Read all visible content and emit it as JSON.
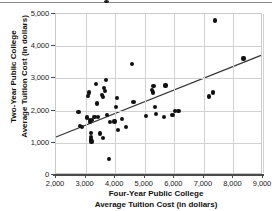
{
  "chart_data": {
    "type": "scatter",
    "title": "",
    "xlabel": "Four-Year Public College Average Tuition Cost (in dollars)",
    "xlabel_line1": "Four-Year Public College",
    "xlabel_line2": "Average Tuition Cost (in dollars)",
    "ylabel": "Two-Year Public College Average Tuition Cost (in dollars)",
    "ylabel_line1": "Two-Year Public College",
    "ylabel_line2": "Average Tuition Cost (in dollars)",
    "xlim": [
      2000,
      9000
    ],
    "ylim": [
      0,
      5000
    ],
    "xticks": [
      2000,
      3000,
      4000,
      5000,
      6000,
      7000,
      8000,
      9000
    ],
    "xtick_labels": [
      "2,000",
      "3,000",
      "4,000",
      "5,000",
      "6,000",
      "7,000",
      "8,000",
      "9,000"
    ],
    "yticks": [
      0,
      1000,
      2000,
      3000,
      4000,
      5000
    ],
    "ytick_labels": [
      "0",
      "1,000",
      "2,000",
      "3,000",
      "4,000",
      "5,000"
    ],
    "grid": true,
    "legend": "none",
    "marker_color": "#111111",
    "trendline_color": "#333333",
    "trendline": {
      "x": [
        2000,
        9000
      ],
      "y": [
        1130,
        3700
      ],
      "note": "least-squares line of best fit"
    },
    "points": [
      {
        "x": 2760,
        "y": 1960
      },
      {
        "x": 2800,
        "y": 1520
      },
      {
        "x": 2880,
        "y": 1500
      },
      {
        "x": 3040,
        "y": 1800
      },
      {
        "x": 3060,
        "y": 1770
      },
      {
        "x": 3080,
        "y": 2450
      },
      {
        "x": 3120,
        "y": 2560
      },
      {
        "x": 3140,
        "y": 1720
      },
      {
        "x": 3150,
        "y": 1640
      },
      {
        "x": 3170,
        "y": 1310
      },
      {
        "x": 3180,
        "y": 1180
      },
      {
        "x": 3190,
        "y": 1100
      },
      {
        "x": 3200,
        "y": 1040
      },
      {
        "x": 3220,
        "y": 1700
      },
      {
        "x": 3300,
        "y": 1790
      },
      {
        "x": 3340,
        "y": 2820
      },
      {
        "x": 3380,
        "y": 2220
      },
      {
        "x": 3420,
        "y": 1800
      },
      {
        "x": 3500,
        "y": 1290
      },
      {
        "x": 3560,
        "y": 2480
      },
      {
        "x": 3580,
        "y": 2410
      },
      {
        "x": 3600,
        "y": 1150
      },
      {
        "x": 3620,
        "y": 2700
      },
      {
        "x": 3660,
        "y": 2620
      },
      {
        "x": 3680,
        "y": 2960
      },
      {
        "x": 3720,
        "y": 1870
      },
      {
        "x": 3780,
        "y": 500
      },
      {
        "x": 3820,
        "y": 1640
      },
      {
        "x": 3980,
        "y": 1660
      },
      {
        "x": 4020,
        "y": 2100
      },
      {
        "x": 4060,
        "y": 2390
      },
      {
        "x": 4100,
        "y": 1410
      },
      {
        "x": 4240,
        "y": 1740
      },
      {
        "x": 4380,
        "y": 1500
      },
      {
        "x": 4560,
        "y": 3440
      },
      {
        "x": 4620,
        "y": 2260
      },
      {
        "x": 5040,
        "y": 1820
      },
      {
        "x": 5240,
        "y": 2640
      },
      {
        "x": 5280,
        "y": 2560
      },
      {
        "x": 5300,
        "y": 2760
      },
      {
        "x": 5340,
        "y": 2120
      },
      {
        "x": 5380,
        "y": 1900
      },
      {
        "x": 5640,
        "y": 1800
      },
      {
        "x": 5700,
        "y": 2780
      },
      {
        "x": 5940,
        "y": 1860
      },
      {
        "x": 6020,
        "y": 1980
      },
      {
        "x": 6140,
        "y": 1980
      },
      {
        "x": 7180,
        "y": 2440
      },
      {
        "x": 7320,
        "y": 2560
      },
      {
        "x": 7380,
        "y": 4800
      },
      {
        "x": 8340,
        "y": 3620
      }
    ]
  }
}
